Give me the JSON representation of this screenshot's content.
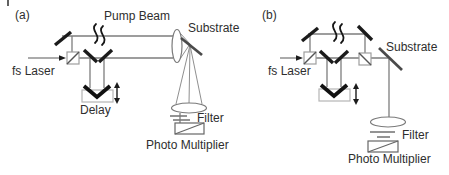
{
  "figure": {
    "colors": {
      "background": "#ffffff",
      "beam_gray": "#7d7d7d",
      "optics_black": "#1b1b1b",
      "text": "#2e2e2e"
    },
    "panels": [
      {
        "id": "a",
        "letter": "(a)",
        "labels": {
          "pump_beam": "Pump Beam",
          "substrate": "Substrate",
          "fs_laser": "fs Laser",
          "delay": "Delay",
          "filter": "Filter",
          "photo_multiplier": "Photo Multiplier"
        }
      },
      {
        "id": "b",
        "letter": "(b)",
        "labels": {
          "substrate": "Substrate",
          "fs_laser": "fs Laser",
          "filter": "Filter",
          "photo_multiplier": "Photo Multiplier"
        }
      }
    ]
  }
}
